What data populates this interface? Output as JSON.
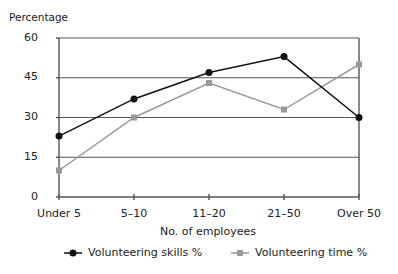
{
  "chart_data": {
    "type": "line",
    "title": "",
    "xlabel": "No. of employees",
    "ylabel": "Percentage",
    "categories": [
      "Under 5",
      "5–10",
      "11–20",
      "21–50",
      "Over 50"
    ],
    "series": [
      {
        "name": "Volunteering skills %",
        "marker": "circle",
        "color": "#111111",
        "values": [
          23,
          37,
          47,
          53,
          30
        ]
      },
      {
        "name": "Volunteering time %",
        "marker": "square",
        "color": "#999999",
        "values": [
          10,
          30,
          43,
          33,
          50
        ]
      }
    ],
    "ylim": [
      0,
      60
    ],
    "yticks": [
      "0",
      "15",
      "30",
      "45",
      "60"
    ],
    "grid": true,
    "legend_position": "bottom"
  }
}
